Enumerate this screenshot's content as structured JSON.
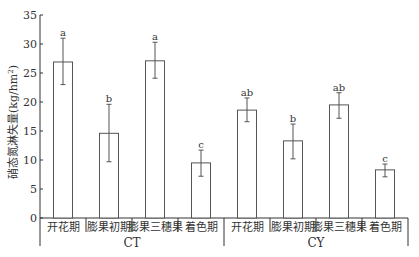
{
  "chart_data": {
    "type": "bar",
    "title": "",
    "xlabel": "",
    "ylabel": "硝态氮淋失量(kg/hm²)",
    "ylabel_parts": {
      "main": "硝态氮淋失量(kg/hm",
      "sup": "2",
      "close": ")"
    },
    "ylim": [
      0,
      35
    ],
    "yticks": [
      0,
      5,
      10,
      15,
      20,
      25,
      30,
      35
    ],
    "grid": false,
    "legend": null,
    "groups": [
      {
        "name": "CT",
        "categories": [
          "开花期",
          "膨果初期",
          "膨果三穗果",
          "着色期"
        ],
        "values": [
          26.9,
          14.6,
          27.1,
          9.5
        ],
        "error_low": [
          23.0,
          9.7,
          24.1,
          7.2
        ],
        "error_high": [
          31.0,
          19.6,
          30.3,
          11.7
        ],
        "significance": [
          "a",
          "b",
          "a",
          "c"
        ]
      },
      {
        "name": "CY",
        "categories": [
          "开花期",
          "膨果初期",
          "膨果三穗果",
          "着色期"
        ],
        "values": [
          18.6,
          13.3,
          19.5,
          8.3
        ],
        "error_low": [
          16.6,
          10.2,
          17.2,
          7.1
        ],
        "error_high": [
          20.7,
          16.2,
          21.6,
          9.3
        ],
        "significance": [
          "ab",
          "b",
          "ab",
          "c"
        ]
      }
    ],
    "bar_fill": "#ffffff",
    "bar_stroke": "#555555",
    "axis_color": "#333333"
  }
}
